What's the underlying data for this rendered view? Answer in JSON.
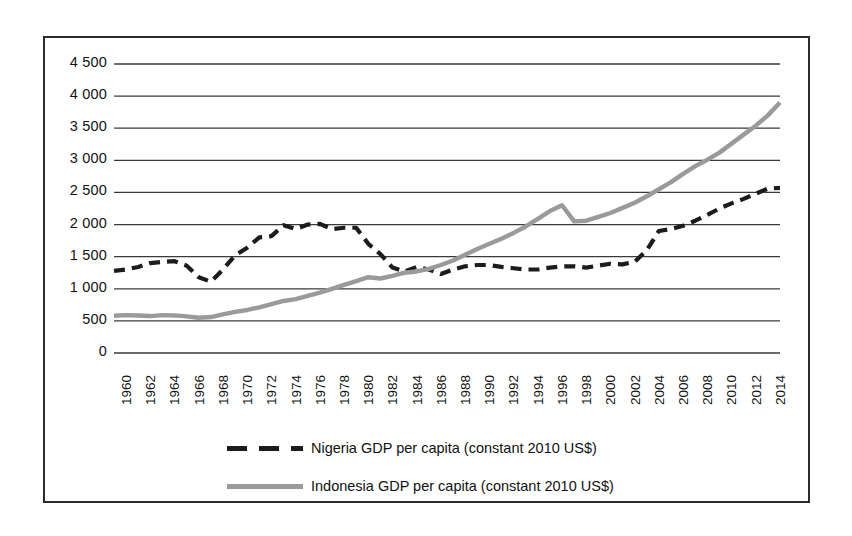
{
  "chart_data": {
    "type": "line",
    "title": "",
    "subtitle": "",
    "xlabel": "",
    "ylabel": "",
    "xlim": [
      1960,
      2015
    ],
    "ylim": [
      0,
      4500
    ],
    "grid": true,
    "grid_axis": "y",
    "legend_position": "bottom",
    "y_ticks": [
      "4 500",
      "4 000",
      "3 500",
      "3 000",
      "2 500",
      "2 000",
      "1 500",
      "1 000",
      "500",
      "0"
    ],
    "y_tick_values": [
      4500,
      4000,
      3500,
      3000,
      2500,
      2000,
      1500,
      1000,
      500,
      0
    ],
    "x_ticks": [
      "1960",
      "1962",
      "1964",
      "1966",
      "1968",
      "1970",
      "1972",
      "1974",
      "1976",
      "1978",
      "1980",
      "1982",
      "1984",
      "1986",
      "1988",
      "1990",
      "1992",
      "1994",
      "1996",
      "1998",
      "2000",
      "2002",
      "2004",
      "2006",
      "2008",
      "2010",
      "2012",
      "2014"
    ],
    "x": [
      1960,
      1961,
      1962,
      1963,
      1964,
      1965,
      1966,
      1967,
      1968,
      1969,
      1970,
      1971,
      1972,
      1973,
      1974,
      1975,
      1976,
      1977,
      1978,
      1979,
      1980,
      1981,
      1982,
      1983,
      1984,
      1985,
      1986,
      1987,
      1988,
      1989,
      1990,
      1991,
      1992,
      1993,
      1994,
      1995,
      1996,
      1997,
      1998,
      1999,
      2000,
      2001,
      2002,
      2003,
      2004,
      2005,
      2006,
      2007,
      2008,
      2009,
      2010,
      2011,
      2012,
      2013,
      2014,
      2015
    ],
    "series": [
      {
        "name": "Nigeria GDP per capita (constant 2010 US$)",
        "style": "dashed",
        "color": "#1c1c1c",
        "values": [
          1280,
          1300,
          1340,
          1400,
          1420,
          1430,
          1360,
          1180,
          1110,
          1300,
          1520,
          1640,
          1800,
          1820,
          1990,
          1930,
          2000,
          2010,
          1930,
          1950,
          1950,
          1700,
          1540,
          1330,
          1270,
          1340,
          1300,
          1230,
          1300,
          1350,
          1370,
          1370,
          1340,
          1320,
          1300,
          1300,
          1330,
          1350,
          1350,
          1330,
          1360,
          1390,
          1380,
          1420,
          1600,
          1900,
          1930,
          1980,
          2060,
          2150,
          2250,
          2330,
          2400,
          2480,
          2560,
          2570
        ]
      },
      {
        "name": "Indonesia GDP per capita (constant 2010 US$)",
        "style": "solid",
        "color": "#9a9a9a",
        "values": [
          580,
          590,
          585,
          575,
          590,
          585,
          570,
          548,
          560,
          600,
          640,
          670,
          710,
          760,
          810,
          840,
          890,
          940,
          1000,
          1060,
          1120,
          1180,
          1160,
          1200,
          1250,
          1270,
          1310,
          1370,
          1440,
          1530,
          1620,
          1700,
          1780,
          1870,
          1970,
          2090,
          2210,
          2300,
          2050,
          2060,
          2120,
          2180,
          2260,
          2340,
          2440,
          2550,
          2660,
          2790,
          2910,
          3010,
          3120,
          3260,
          3400,
          3540,
          3700,
          3900
        ]
      }
    ],
    "annotations": []
  },
  "legend": {
    "entries": [
      {
        "label": "Nigeria GDP per capita (constant 2010 US$)",
        "style": "dashed"
      },
      {
        "label": "Indonesia GDP per capita (constant 2010 US$)",
        "style": "solid"
      }
    ]
  }
}
